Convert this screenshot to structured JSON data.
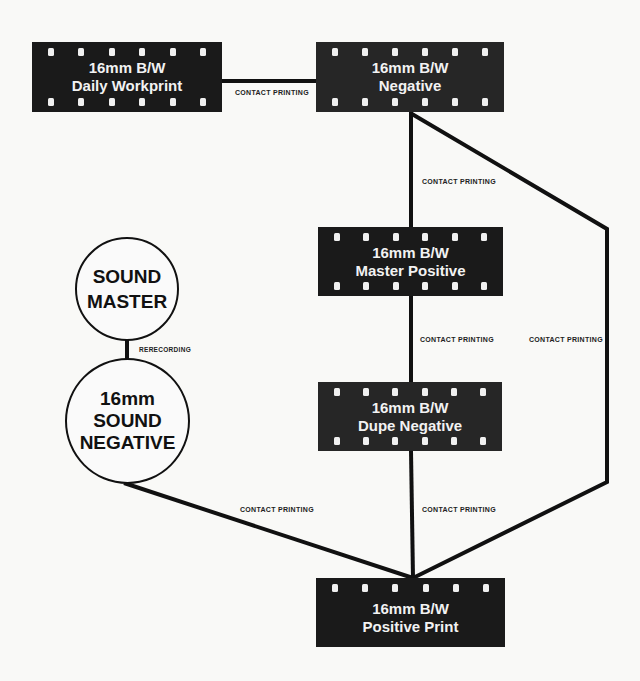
{
  "nodes": {
    "workprint": {
      "line1": "16mm B/W",
      "line2": "Daily Workprint"
    },
    "negative": {
      "line1": "16mm B/W",
      "line2": "Negative"
    },
    "master_positive": {
      "line1": "16mm B/W",
      "line2": "Master Positive"
    },
    "dupe_negative": {
      "line1": "16mm B/W",
      "line2": "Dupe Negative"
    },
    "positive_print": {
      "line1": "16mm B/W",
      "line2": "Positive Print"
    },
    "sound_master": {
      "line1": "SOUND",
      "line2": "MASTER"
    },
    "sound_negative": {
      "line1": "16mm",
      "line2": "SOUND",
      "line3": "NEGATIVE"
    }
  },
  "edges": {
    "workprint_negative": "CONTACT PRINTING",
    "negative_master": "CONTACT PRINTING",
    "master_dupe": "CONTACT PRINTING",
    "negative_print": "CONTACT PRINTING",
    "dupe_print": "CONTACT PRINTING",
    "soundneg_print": "CONTACT PRINTING",
    "soundmaster_soundneg": "RERECORDING"
  }
}
